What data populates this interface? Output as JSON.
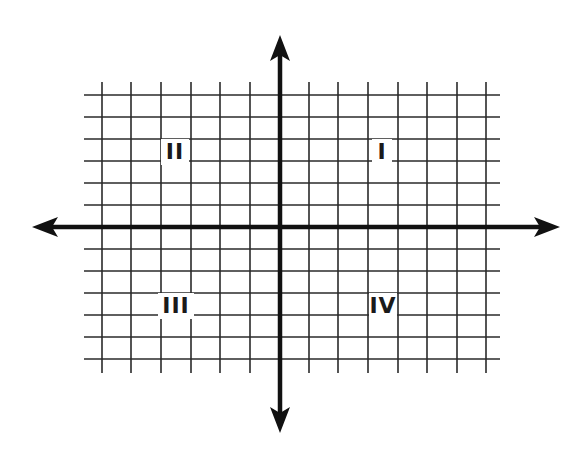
{
  "diagram": {
    "title": "",
    "type": "cartesian-coordinate-plane",
    "colors": {
      "grid": "#2a2a2a",
      "axis": "#111111",
      "label": "#1a1a1a",
      "background": "#ffffff"
    },
    "origin": {
      "x": 280,
      "y": 227
    },
    "grid": {
      "vertical_lines_x": [
        102,
        131,
        161,
        191,
        220,
        250,
        309,
        338,
        368,
        398,
        427,
        457,
        486
      ],
      "horizontal_lines_y": [
        95,
        117,
        139,
        161,
        183,
        205,
        249,
        271,
        293,
        315,
        337,
        359
      ],
      "x_extent": [
        84,
        500
      ],
      "y_extent": [
        82,
        373
      ]
    },
    "axes": {
      "x_axis": {
        "from": 32,
        "to": 560,
        "arrows": "both"
      },
      "y_axis": {
        "from": 35,
        "to": 433,
        "arrows": "both"
      }
    },
    "quadrants": [
      {
        "label": "I",
        "x": 382,
        "y": 159
      },
      {
        "label": "II",
        "x": 175,
        "y": 159
      },
      {
        "label": "III",
        "x": 176,
        "y": 313
      },
      {
        "label": "IV",
        "x": 383,
        "y": 313
      }
    ]
  }
}
